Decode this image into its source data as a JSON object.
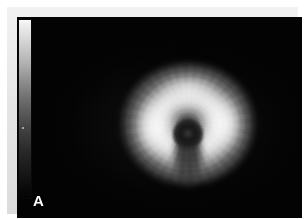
{
  "figure": {
    "panel_label": "A",
    "background_color": "#030303",
    "frame_color": "#e8e8e8",
    "modality_caption": ""
  },
  "colorbar": {
    "name": "grayscale-intensity-colorbar",
    "orientation": "vertical",
    "high_end": "top",
    "low_end": "bottom",
    "high_color": "#f6f6f6",
    "low_color": "#040404",
    "tick_labels": []
  },
  "chart_data": {
    "type": "heatmap",
    "title": "",
    "subtitle": "",
    "xlabel": "",
    "ylabel": "",
    "projection": "polar-bullseye",
    "colormap": "grayscale",
    "colorbar": {
      "orientation": "vertical",
      "position": "left",
      "min_label": "",
      "max_label": "",
      "min_value": 0,
      "max_value": 100
    },
    "grid": false,
    "legend_position": "left",
    "annotations": [
      {
        "text": "A",
        "position": "bottom-left",
        "color": "#ffffff"
      }
    ],
    "geometry": {
      "center_x": 171,
      "center_y": 117,
      "outer_radius_px": 70,
      "core_radius_px": 15
    },
    "radial_bins": [
      0.15,
      0.35,
      0.7,
      0.95,
      1.0,
      0.88,
      0.62,
      0.3,
      0.12
    ],
    "angular_bins_deg": [
      0,
      45,
      90,
      135,
      180,
      225,
      270,
      315
    ],
    "series": [
      {
        "name": "ring-0 (apex/core)",
        "values": [
          0.12,
          0.12,
          0.11,
          0.12,
          0.13,
          0.12,
          0.11,
          0.12
        ]
      },
      {
        "name": "ring-1",
        "values": [
          0.55,
          0.62,
          0.68,
          0.6,
          0.3,
          0.28,
          0.52,
          0.58
        ]
      },
      {
        "name": "ring-2",
        "values": [
          0.86,
          0.92,
          0.95,
          0.9,
          0.42,
          0.4,
          0.88,
          0.9
        ]
      },
      {
        "name": "ring-3 (mid, bright)",
        "values": [
          0.92,
          0.98,
          1.0,
          0.96,
          0.5,
          0.48,
          0.95,
          0.97
        ]
      },
      {
        "name": "ring-4",
        "values": [
          0.74,
          0.8,
          0.84,
          0.78,
          0.44,
          0.42,
          0.8,
          0.82
        ]
      },
      {
        "name": "ring-5 (basal rim)",
        "values": [
          0.38,
          0.42,
          0.46,
          0.4,
          0.26,
          0.25,
          0.43,
          0.44
        ]
      }
    ],
    "features": [
      {
        "name": "bright-perfusion-ring",
        "intensity": 1.0,
        "description": "high-uptake donut"
      },
      {
        "name": "dark-central-core",
        "intensity": 0.1,
        "description": "low-uptake apical center"
      },
      {
        "name": "inferior-dark-wedge",
        "intensity": 0.18,
        "description": "defect extending inferiorly from core"
      },
      {
        "name": "dim-outer-rim",
        "intensity": 0.35,
        "description": "attenuated basal border"
      }
    ]
  }
}
